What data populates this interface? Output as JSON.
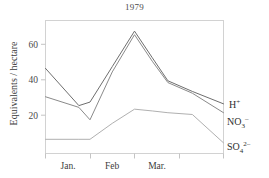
{
  "chart_data": {
    "type": "line",
    "title": "1979",
    "xlabel": "",
    "ylabel": "Equivalents / hectare",
    "xlim": [
      0,
      4
    ],
    "ylim": [
      0,
      75
    ],
    "yticks": [
      20,
      40,
      60
    ],
    "ytick_labels": [
      "20",
      "40",
      "60"
    ],
    "xtick_labels": [
      "Jan.",
      "Feb",
      "Mar."
    ],
    "grid": false,
    "legend_position": "right-inline",
    "x": [
      0.0,
      0.75,
      1.0,
      1.5,
      2.0,
      2.4,
      2.75,
      3.3,
      4.0
    ],
    "series": [
      {
        "name": "H+",
        "label_main": "H",
        "label_sup": "+",
        "label_sub": "",
        "color": "#6e6e6e",
        "values": [
          48,
          27,
          29,
          49,
          69,
          54,
          41,
          35,
          28
        ]
      },
      {
        "name": "NO3-",
        "label_main": "NO",
        "label_sub": "3",
        "label_sup": "–",
        "color": "#8a8a8a",
        "values": [
          32,
          26,
          19,
          46,
          67,
          52,
          40,
          34,
          23
        ]
      },
      {
        "name": "SO4 2-",
        "label_main": "SO",
        "label_sub": "4",
        "label_sup": "2–",
        "color": "#b0b0b0",
        "values": [
          8,
          8,
          8,
          17,
          25,
          24,
          23,
          22,
          6
        ]
      }
    ]
  },
  "axis": {
    "y_tick_20": "20",
    "y_tick_40": "40",
    "y_tick_60": "60",
    "x_tick_jan": "Jan.",
    "x_tick_feb": "Feb",
    "x_tick_mar": "Mar."
  },
  "legend": {
    "h_main": "H",
    "h_sup": "+",
    "no3_main": "NO",
    "no3_sub": "3",
    "no3_sup": "–",
    "so4_main": "SO",
    "so4_sub": "4",
    "so4_sup": "2–"
  },
  "colors": {
    "frame": "#d2d2d2",
    "text": "#3a3a3a",
    "background": "#ffffff"
  }
}
